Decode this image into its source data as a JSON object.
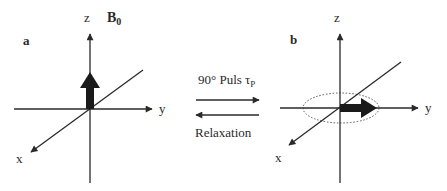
{
  "panels": {
    "a": {
      "label": "a",
      "axes": {
        "z": "z",
        "y": "y",
        "x": "x"
      },
      "field_label": "B",
      "field_subscript": "0",
      "magnetization_direction": "z"
    },
    "b": {
      "label": "b",
      "axes": {
        "z": "z",
        "y": "y",
        "x": "x"
      },
      "magnetization_direction": "y",
      "precession_ellipse": true
    }
  },
  "transitions": {
    "forward": {
      "label": "90° Puls τ",
      "subscript": "P",
      "direction": "a-to-b"
    },
    "backward": {
      "label": "Relaxation",
      "direction": "b-to-a"
    }
  },
  "colors": {
    "line": "#2a2a2a",
    "arrow_fill": "#1a1a1a",
    "ellipse": "#555555"
  }
}
